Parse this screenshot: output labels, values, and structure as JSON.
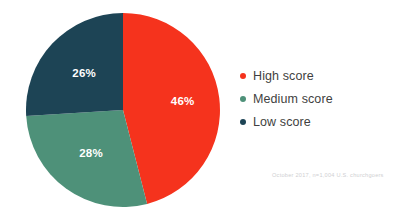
{
  "chart_data": {
    "type": "pie",
    "title": "",
    "subtitle": "",
    "xlabel": "",
    "ylabel": "",
    "categories": [
      "High score",
      "Medium score",
      "Low score"
    ],
    "values": [
      46,
      28,
      26
    ],
    "value_labels": [
      "46%",
      "28%",
      "26%"
    ],
    "colors": [
      "#F5331D",
      "#4E9179",
      "#1D4455"
    ],
    "legend_position": "right",
    "grid": false,
    "start_angle_deg": 0,
    "direction": "clockwise",
    "annotations": [
      "October 2017, n=1,004 U.S. churchgoers"
    ],
    "slices": [
      {
        "label": "High score",
        "value": 46,
        "display": "46%",
        "color": "#F5331D"
      },
      {
        "label": "Medium score",
        "value": 28,
        "display": "28%",
        "color": "#4E9179"
      },
      {
        "label": "Low score",
        "value": 26,
        "display": "26%",
        "color": "#1D4455"
      }
    ]
  },
  "legend": {
    "items": [
      {
        "label": "High score",
        "color": "#F5331D"
      },
      {
        "label": "Medium score",
        "color": "#4E9179"
      },
      {
        "label": "Low score",
        "color": "#1D4455"
      }
    ]
  },
  "footnote": {
    "text": "October 2017, n=1,004 U.S. churchgoers"
  },
  "labels": {
    "high": "46%",
    "medium": "28%",
    "low": "26%"
  }
}
